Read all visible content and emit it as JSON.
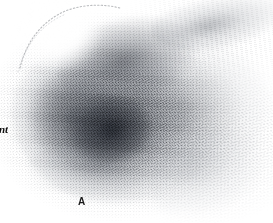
{
  "figure": {
    "panel_label": "A",
    "edge_caption_fragment": "nt",
    "background_color": "#ffffff",
    "ink_color": "#1a1a1a"
  },
  "labels": {
    "panel_a": "A",
    "cropped_word_fragment": "nt"
  },
  "specimen": {
    "description_name": "diffuse-stipple-mass",
    "tone_dark": "#2a2e36",
    "tone_mid": "#8a8e96",
    "tone_light": "#c8ccd2"
  }
}
